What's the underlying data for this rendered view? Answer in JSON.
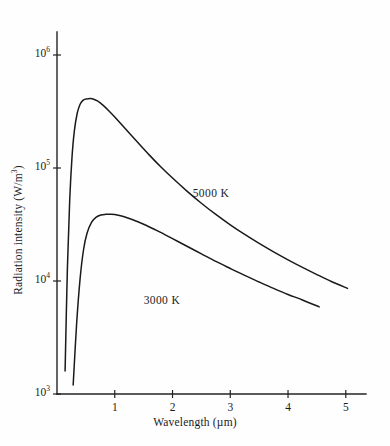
{
  "figure": {
    "background_color": "#fefefe",
    "ink_color": "#1a1a1a"
  },
  "chart_data": {
    "type": "line",
    "title": "",
    "xlabel": "Wavelength (µm)",
    "ylabel": "Radiation intensity  (W/m³)",
    "xscale": "linear",
    "yscale": "log",
    "xlim": [
      0,
      5.35
    ],
    "ylim": [
      1000,
      1600000
    ],
    "grid": false,
    "legend_position": "inline-annotation",
    "xticks": [
      1,
      2,
      3,
      4,
      5
    ],
    "xtick_labels": [
      "1",
      "2",
      "3",
      "4",
      "5"
    ],
    "yticks": [
      1000,
      10000,
      100000,
      1000000
    ],
    "ytick_labels": [
      "10³",
      "10⁴",
      "10⁵",
      "10⁶"
    ],
    "ytick_mantissa": "10",
    "ytick_exponents": [
      "3",
      "4",
      "5",
      "6"
    ],
    "series": [
      {
        "name": "5000 K",
        "temperature_k": 5000,
        "annotation": "5000 K",
        "annotation_x": 2.8,
        "annotation_y": 58000,
        "x_start": 0.14,
        "x_end": 5.03,
        "peak_x": 0.61,
        "peak_y": 410000,
        "x": [
          0.14,
          0.18,
          0.22,
          0.26,
          0.3,
          0.35,
          0.4,
          0.45,
          0.5,
          0.55,
          0.61,
          0.7,
          0.8,
          0.9,
          1.0,
          1.2,
          1.4,
          1.6,
          1.8,
          2.0,
          2.25,
          2.5,
          2.75,
          3.0,
          3.25,
          3.5,
          3.75,
          4.0,
          4.25,
          4.5,
          4.75,
          5.03
        ],
        "y": [
          1600,
          13000,
          52000,
          125000,
          212000,
          305000,
          367000,
          397000,
          408000,
          411000,
          410000,
          392000,
          358000,
          320000,
          283000,
          218000,
          168000,
          130000,
          102000,
          81500,
          62500,
          48800,
          38800,
          31400,
          25800,
          21500,
          18100,
          15400,
          13200,
          11400,
          9900,
          8600
        ],
        "y_end": 2200
      },
      {
        "name": "3000 K",
        "temperature_k": 3000,
        "annotation": "3000 K",
        "annotation_x": 1.95,
        "annotation_y": 6500,
        "x_start": 0.28,
        "x_end": 4.54,
        "peak_x": 0.93,
        "peak_y": 39000,
        "x": [
          0.28,
          0.34,
          0.4,
          0.46,
          0.52,
          0.6,
          0.68,
          0.76,
          0.84,
          0.93,
          1.0,
          1.15,
          1.3,
          1.5,
          1.75,
          2.0,
          2.25,
          2.5,
          2.75,
          3.0,
          3.25,
          3.5,
          3.75,
          4.0,
          4.25,
          4.54
        ],
        "y": [
          1200,
          4200,
          10500,
          19000,
          26500,
          33200,
          36800,
          38400,
          38900,
          39000,
          38700,
          37200,
          35000,
          31800,
          27600,
          23700,
          20300,
          17400,
          14900,
          12900,
          11200,
          9800,
          8600,
          7600,
          6800,
          5900
        ],
        "y_end": 1600
      }
    ]
  },
  "annotations": {
    "label_5000": "5000 K",
    "label_3000": "3000 K"
  },
  "axis_titles": {
    "x": "Wavelength (µm)",
    "y_prefix": "Radiation intensity  (W/m",
    "y_exponent": "3",
    "y_suffix": ")"
  }
}
